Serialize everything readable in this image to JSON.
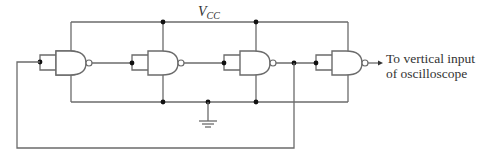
{
  "diagram": {
    "type": "ring-oscillator-circuit",
    "supply_label": {
      "main": "V",
      "subscript": "CC"
    },
    "output_label": [
      "To vertical input",
      "of oscilloscope"
    ],
    "gates": [
      {
        "id": "gate-1",
        "type": "NAND",
        "inputs_tied": true
      },
      {
        "id": "gate-2",
        "type": "NAND",
        "inputs_tied": true
      },
      {
        "id": "gate-3",
        "type": "NAND",
        "inputs_tied": true
      },
      {
        "id": "gate-4",
        "type": "NAND",
        "inputs_tied": true
      }
    ],
    "symbols": [
      "ground-icon",
      "junction-dot",
      "inversion-bubble",
      "output-arrow"
    ],
    "colors": {
      "wire": "#6b6b6b",
      "junction": "#111111",
      "text": "#333333"
    }
  }
}
